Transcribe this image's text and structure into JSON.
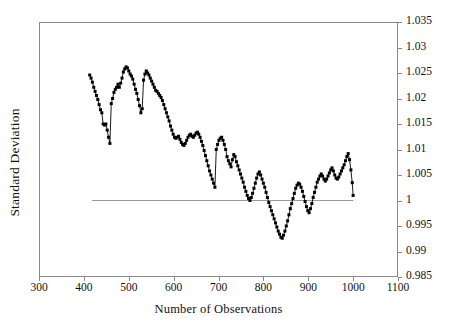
{
  "chart_data": {
    "type": "line",
    "title": "",
    "subtitle": "",
    "xlabel": "Number of Observations",
    "ylabel": "Standard Deviation",
    "xlim": [
      300,
      1100
    ],
    "ylim": [
      0.985,
      1.035
    ],
    "xticks": [
      300,
      400,
      500,
      600,
      700,
      800,
      900,
      1000,
      1100
    ],
    "yticks": [
      0.985,
      0.99,
      0.995,
      1,
      1.005,
      1.01,
      1.015,
      1.02,
      1.025,
      1.03,
      1.035
    ],
    "xtick_labels": [
      "300",
      "400",
      "500",
      "600",
      "700",
      "800",
      "900",
      "1000",
      "1100"
    ],
    "ytick_labels": [
      "1.035",
      "1.03",
      "1.025",
      "1.02",
      "1.015",
      "1.01",
      "1.005",
      "1",
      "0.995",
      "0.99",
      "0.985"
    ],
    "grid": false,
    "legend": null,
    "legend_position": "none",
    "y_axis_side": "right",
    "marker": "filled-square",
    "marker_color": "#000000",
    "line_color": "#000000",
    "frame_color": "#8a8a8a",
    "annotations": [
      {
        "name": "reference-line",
        "type": "hline",
        "y": 1.0,
        "x_start": 418,
        "x_end": 1000,
        "color": "#9a9a9a",
        "label": ""
      }
    ],
    "series": [
      {
        "name": "Standard Deviation",
        "color": "#000000",
        "x": [
          413,
          416,
          419,
          422,
          425,
          428,
          431,
          434,
          437,
          440,
          443,
          446,
          449,
          452,
          455,
          458,
          461,
          464,
          467,
          470,
          473,
          476,
          479,
          482,
          485,
          488,
          491,
          494,
          497,
          500,
          503,
          506,
          509,
          512,
          515,
          518,
          521,
          524,
          527,
          530,
          533,
          536,
          539,
          542,
          545,
          548,
          551,
          554,
          557,
          560,
          563,
          566,
          569,
          572,
          575,
          578,
          581,
          584,
          587,
          590,
          593,
          596,
          599,
          602,
          605,
          608,
          611,
          614,
          617,
          620,
          623,
          626,
          629,
          632,
          635,
          638,
          641,
          644,
          647,
          650,
          653,
          656,
          659,
          662,
          665,
          668,
          671,
          674,
          677,
          680,
          683,
          686,
          689,
          692,
          695,
          698,
          701,
          704,
          707,
          710,
          713,
          716,
          719,
          722,
          725,
          728,
          731,
          734,
          737,
          740,
          743,
          746,
          749,
          752,
          755,
          758,
          761,
          764,
          767,
          770,
          773,
          776,
          779,
          782,
          785,
          788,
          791,
          794,
          797,
          800,
          803,
          806,
          809,
          812,
          815,
          818,
          821,
          824,
          827,
          830,
          833,
          836,
          839,
          842,
          845,
          848,
          851,
          854,
          857,
          860,
          863,
          866,
          869,
          872,
          875,
          878,
          881,
          884,
          887,
          890,
          893,
          896,
          899,
          902,
          905,
          908,
          911,
          914,
          917,
          920,
          923,
          926,
          929,
          932,
          935,
          938,
          941,
          944,
          947,
          950,
          953,
          956,
          959,
          962,
          965,
          968,
          971,
          974,
          977,
          980,
          983,
          986,
          989,
          992,
          995,
          998,
          1000
        ],
        "y": [
          1.0246,
          1.024,
          1.0232,
          1.0222,
          1.0214,
          1.0206,
          1.0198,
          1.0188,
          1.0178,
          1.0172,
          1.015,
          1.0148,
          1.015,
          1.0138,
          1.0124,
          1.0112,
          1.019,
          1.02,
          1.0212,
          1.0218,
          1.0222,
          1.0228,
          1.0222,
          1.023,
          1.024,
          1.0252,
          1.0258,
          1.0262,
          1.026,
          1.0254,
          1.0248,
          1.0244,
          1.0238,
          1.0228,
          1.0218,
          1.021,
          1.0198,
          1.0186,
          1.0172,
          1.018,
          1.0236,
          1.0248,
          1.0254,
          1.025,
          1.0246,
          1.024,
          1.0234,
          1.0228,
          1.0222,
          1.0216,
          1.0214,
          1.021,
          1.0206,
          1.0202,
          1.0196,
          1.0188,
          1.018,
          1.0172,
          1.0164,
          1.0156,
          1.0146,
          1.0138,
          1.013,
          1.0124,
          1.0122,
          1.0124,
          1.0126,
          1.012,
          1.0114,
          1.011,
          1.0108,
          1.0112,
          1.0118,
          1.0124,
          1.0128,
          1.013,
          1.0126,
          1.0124,
          1.0128,
          1.0132,
          1.0134,
          1.013,
          1.0124,
          1.0116,
          1.0108,
          1.0098,
          1.0088,
          1.0078,
          1.0068,
          1.0058,
          1.005,
          1.0042,
          1.0034,
          1.0026,
          1.01,
          1.011,
          1.0118,
          1.0122,
          1.0124,
          1.0118,
          1.011,
          1.01,
          1.0086,
          1.0078,
          1.0072,
          1.0066,
          1.008,
          1.009,
          1.0086,
          1.0076,
          1.0068,
          1.006,
          1.0052,
          1.0044,
          1.0036,
          1.0026,
          1.0018,
          1.001,
          1.0004,
          1.0,
          1.0006,
          1.0014,
          1.0024,
          1.0034,
          1.0044,
          1.0052,
          1.0056,
          1.005,
          1.0042,
          1.0034,
          1.0026,
          1.0016,
          1.0006,
          0.9996,
          0.9988,
          0.998,
          0.9972,
          0.9964,
          0.9956,
          0.9948,
          0.994,
          0.9934,
          0.9928,
          0.9926,
          0.9932,
          0.994,
          0.995,
          0.996,
          0.9972,
          0.9984,
          0.9994,
          1.0004,
          1.0014,
          1.0024,
          1.003,
          1.0034,
          1.0032,
          1.0026,
          1.0018,
          1.0008,
          0.9998,
          0.9988,
          0.998,
          0.9976,
          0.9984,
          0.9994,
          1.0006,
          1.0016,
          1.0026,
          1.0036,
          1.0042,
          1.0048,
          1.0052,
          1.0048,
          1.0042,
          1.0038,
          1.0042,
          1.0048,
          1.0054,
          1.006,
          1.0064,
          1.0058,
          1.005,
          1.0044,
          1.0042,
          1.0046,
          1.0052,
          1.0058,
          1.0064,
          1.007,
          1.0078,
          1.0086,
          1.0092,
          1.008,
          1.006,
          1.0035,
          1.001
        ]
      }
    ]
  }
}
